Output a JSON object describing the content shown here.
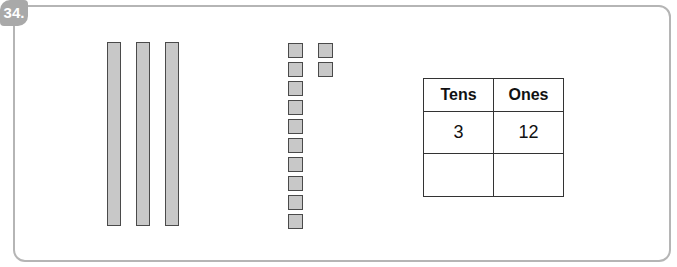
{
  "problem": {
    "number": "34.",
    "tens_rods": 3,
    "ones_cubes_column1": 10,
    "ones_cubes_column2": 2,
    "table": {
      "headers": [
        "Tens",
        "Ones"
      ],
      "rows": [
        [
          "3",
          "12"
        ],
        [
          "",
          ""
        ]
      ]
    },
    "colors": {
      "badge": "#a9a9a9",
      "block_fill": "#c8c8c8",
      "block_border": "#4a4a4a",
      "frame": "#b5b5b5"
    }
  }
}
